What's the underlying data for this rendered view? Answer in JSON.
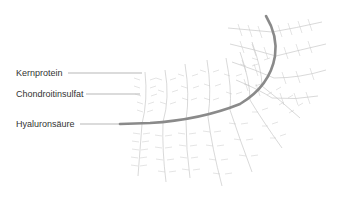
{
  "diagram": {
    "labels": [
      {
        "id": "kernprotein",
        "text": "Kernprotein"
      },
      {
        "id": "chondroitinsulfat",
        "text": "Chondroitinsulfat"
      },
      {
        "id": "hyaluronsaeure",
        "text": "Hyaluronsäure"
      }
    ],
    "colors": {
      "backbone": "#8a8a8a",
      "branches": "#c8c8c8",
      "leader_lines": "#9a9a9a",
      "text": "#333333"
    }
  }
}
